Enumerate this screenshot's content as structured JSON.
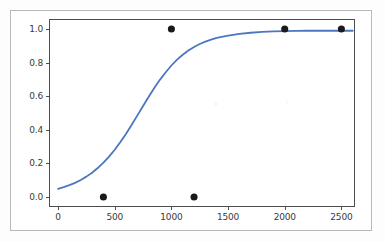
{
  "figure": {
    "title_fragment": "· · ·",
    "background_color": "#fdfdfd",
    "frame_color": "#b9b9b9",
    "axes_color": "#4c4c4c"
  },
  "chart_data": {
    "type": "line",
    "title": "",
    "xlabel": "",
    "ylabel": "",
    "xlim": [
      -80,
      2620
    ],
    "ylim": [
      -0.06,
      1.06
    ],
    "grid": false,
    "legend": null,
    "xticks": [
      0,
      500,
      1000,
      1500,
      2000,
      2500
    ],
    "xtick_labels": [
      "0",
      "500",
      "1000",
      "1500",
      "2000",
      "2500"
    ],
    "yticks": [
      0.0,
      0.2,
      0.4,
      0.6,
      0.8,
      1.0
    ],
    "ytick_labels": [
      "0.0",
      "0.2",
      "0.4",
      "0.6",
      "0.8",
      "1.0"
    ],
    "series": [
      {
        "name": "fitted logistic curve",
        "type": "line",
        "color": "#4c77c0",
        "linewidth": 1.8,
        "x": [
          0,
          50,
          100,
          150,
          200,
          250,
          300,
          350,
          400,
          450,
          500,
          550,
          600,
          650,
          700,
          750,
          800,
          850,
          900,
          950,
          1000,
          1050,
          1100,
          1150,
          1200,
          1250,
          1300,
          1350,
          1400,
          1500,
          1600,
          1700,
          1800,
          1900,
          2000,
          2100,
          2200,
          2300,
          2400,
          2500,
          2600
        ],
        "y": [
          0.048,
          0.058,
          0.07,
          0.084,
          0.101,
          0.121,
          0.144,
          0.172,
          0.204,
          0.24,
          0.281,
          0.327,
          0.377,
          0.43,
          0.486,
          0.542,
          0.597,
          0.65,
          0.699,
          0.743,
          0.783,
          0.818,
          0.847,
          0.872,
          0.893,
          0.911,
          0.925,
          0.937,
          0.947,
          0.961,
          0.971,
          0.978,
          0.983,
          0.986,
          0.988,
          0.989,
          0.99,
          0.99,
          0.99,
          0.99,
          0.99
        ]
      },
      {
        "name": "observed points",
        "type": "scatter",
        "color": "#1a1a1a",
        "marker": "o",
        "markersize": 5.5,
        "points": [
          {
            "x": 400,
            "y": 0.0
          },
          {
            "x": 1000,
            "y": 1.0
          },
          {
            "x": 1200,
            "y": 0.0
          },
          {
            "x": 2000,
            "y": 1.0
          },
          {
            "x": 2500,
            "y": 1.0
          }
        ]
      }
    ]
  }
}
